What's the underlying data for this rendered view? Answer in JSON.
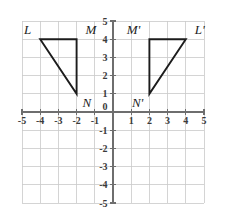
{
  "figure": {
    "background_color": "#ffffff"
  },
  "chart_data": {
    "type": "scatter",
    "title": "",
    "xlabel": "",
    "ylabel": "",
    "xlim": [
      -5,
      5
    ],
    "ylim": [
      -5,
      5
    ],
    "grid": true,
    "grid_step": 1,
    "grid_color": "#c9c9c9",
    "axis_color": "#6e6e6e",
    "shape_color": "#1c1c1c",
    "legend": "none",
    "x_tick_labels": [
      "-5",
      "-4",
      "-3",
      "-2",
      "-1",
      "0",
      "1",
      "2",
      "3",
      "4",
      "5"
    ],
    "x_tick_values": [
      -5,
      -4,
      -3,
      -2,
      -1,
      0,
      1,
      2,
      3,
      4,
      5
    ],
    "y_tick_labels": [
      "5",
      "4",
      "3",
      "2",
      "1",
      "0",
      "-1",
      "-2",
      "-3",
      "-4",
      "-5"
    ],
    "y_tick_values": [
      5,
      4,
      3,
      2,
      1,
      0,
      -1,
      -2,
      -3,
      -4,
      -5
    ],
    "origin_label": "0",
    "series": [
      {
        "name": "Triangle LMN",
        "type": "polygon",
        "closed": true,
        "points": [
          {
            "label": "L",
            "x": -4,
            "y": 4,
            "label_pos": "above-left"
          },
          {
            "label": "M",
            "x": -2,
            "y": 4,
            "label_pos": "above-right"
          },
          {
            "label": "N",
            "x": -2,
            "y": 1,
            "label_pos": "below-right"
          }
        ]
      },
      {
        "name": "Triangle L'M'N'",
        "type": "polygon",
        "closed": true,
        "points": [
          {
            "label": "M'",
            "x": 2,
            "y": 4,
            "label_pos": "above-left"
          },
          {
            "label": "L'",
            "x": 4,
            "y": 4,
            "label_pos": "above-right"
          },
          {
            "label": "N'",
            "x": 2,
            "y": 1,
            "label_pos": "below-left"
          }
        ]
      }
    ],
    "annotations": [
      {
        "text": "L",
        "x": -4,
        "y": 4
      },
      {
        "text": "M",
        "x": -2,
        "y": 4
      },
      {
        "text": "N",
        "x": -2,
        "y": 1
      },
      {
        "text": "M'",
        "x": 2,
        "y": 4
      },
      {
        "text": "L'",
        "x": 4,
        "y": 4
      },
      {
        "text": "N'",
        "x": 2,
        "y": 1
      }
    ]
  }
}
